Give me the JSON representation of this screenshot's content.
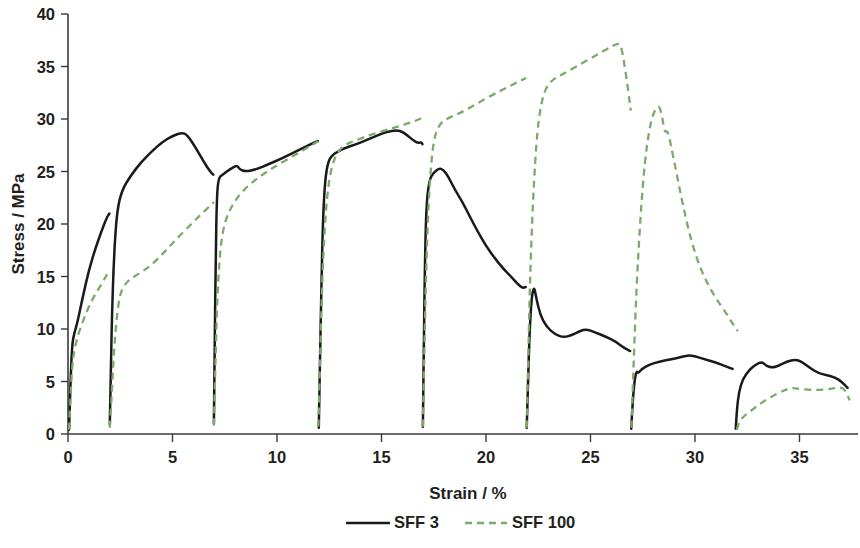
{
  "chart_data": {
    "type": "line",
    "title": "",
    "xlabel": "Strain / %",
    "ylabel": "Stress / MPa",
    "xlim": [
      0,
      37.8
    ],
    "ylim": [
      0,
      40
    ],
    "xticks": [
      0,
      5,
      10,
      15,
      20,
      25,
      30,
      35
    ],
    "yticks": [
      0,
      5,
      10,
      15,
      20,
      25,
      30,
      35,
      40
    ],
    "xtick_labels": [
      "0",
      "5",
      "10",
      "15",
      "20",
      "25",
      "30",
      "35"
    ],
    "ytick_labels": [
      "0",
      "5",
      "10",
      "15",
      "20",
      "25",
      "30",
      "35",
      "40"
    ],
    "grid": false,
    "legend_position": "bottom",
    "series": [
      {
        "name": "SFF 3",
        "color": "#1a1a1a",
        "style": "solid",
        "segments": [
          [
            [
              0.05,
              0.4
            ],
            [
              0.12,
              5.0
            ],
            [
              0.2,
              8.6
            ],
            [
              0.3,
              9.6
            ],
            [
              0.45,
              10.6
            ],
            [
              0.7,
              13.0
            ],
            [
              1.0,
              15.6
            ],
            [
              1.3,
              17.6
            ],
            [
              1.6,
              19.3
            ],
            [
              1.85,
              20.6
            ],
            [
              1.98,
              21.0
            ]
          ],
          [
            [
              2.0,
              0.9
            ],
            [
              2.05,
              6.0
            ],
            [
              2.1,
              11.0
            ],
            [
              2.2,
              17.0
            ],
            [
              2.35,
              21.4
            ],
            [
              2.6,
              23.3
            ],
            [
              3.0,
              24.6
            ],
            [
              3.5,
              25.9
            ],
            [
              4.0,
              26.9
            ],
            [
              4.5,
              27.8
            ],
            [
              5.0,
              28.4
            ],
            [
              5.45,
              28.7
            ],
            [
              5.7,
              28.5
            ],
            [
              6.1,
              27.3
            ],
            [
              6.5,
              25.9
            ],
            [
              6.8,
              25.0
            ],
            [
              6.95,
              24.7
            ]
          ],
          [
            [
              6.98,
              1.0
            ],
            [
              7.02,
              9.0
            ],
            [
              7.07,
              17.0
            ],
            [
              7.12,
              22.5
            ],
            [
              7.2,
              24.4
            ],
            [
              7.4,
              24.7
            ],
            [
              7.8,
              25.3
            ],
            [
              8.1,
              25.6
            ],
            [
              8.2,
              25.2
            ],
            [
              8.5,
              25.0
            ],
            [
              9.0,
              25.2
            ],
            [
              9.6,
              25.7
            ],
            [
              10.3,
              26.3
            ],
            [
              11.0,
              27.0
            ],
            [
              11.6,
              27.6
            ],
            [
              11.95,
              27.9
            ]
          ],
          [
            [
              12.0,
              0.6
            ],
            [
              12.05,
              6.0
            ],
            [
              12.12,
              14.0
            ],
            [
              12.2,
              20.5
            ],
            [
              12.3,
              24.2
            ],
            [
              12.45,
              26.0
            ],
            [
              12.7,
              26.7
            ],
            [
              13.2,
              27.2
            ],
            [
              13.8,
              27.6
            ],
            [
              14.4,
              28.1
            ],
            [
              15.0,
              28.6
            ],
            [
              15.5,
              28.9
            ],
            [
              15.9,
              28.9
            ],
            [
              16.2,
              28.5
            ],
            [
              16.5,
              28.0
            ],
            [
              16.75,
              27.7
            ],
            [
              16.9,
              27.8
            ],
            [
              16.96,
              27.6
            ]
          ],
          [
            [
              16.98,
              0.7
            ],
            [
              17.02,
              8.0
            ],
            [
              17.08,
              16.5
            ],
            [
              17.15,
              22.0
            ],
            [
              17.3,
              24.3
            ],
            [
              17.5,
              24.9
            ],
            [
              17.75,
              25.3
            ],
            [
              17.95,
              25.2
            ],
            [
              18.2,
              24.5
            ],
            [
              18.5,
              23.3
            ],
            [
              18.9,
              22.0
            ],
            [
              19.2,
              20.8
            ],
            [
              19.6,
              19.3
            ],
            [
              20.0,
              17.9
            ],
            [
              20.4,
              16.8
            ],
            [
              20.8,
              15.8
            ],
            [
              21.2,
              15.0
            ],
            [
              21.5,
              14.3
            ],
            [
              21.75,
              13.9
            ],
            [
              21.9,
              14.0
            ]
          ],
          [
            [
              21.95,
              0.6
            ],
            [
              22.0,
              4.0
            ],
            [
              22.08,
              9.5
            ],
            [
              22.18,
              13.0
            ],
            [
              22.3,
              14.1
            ],
            [
              22.4,
              13.0
            ],
            [
              22.6,
              11.3
            ],
            [
              22.9,
              10.2
            ],
            [
              23.3,
              9.5
            ],
            [
              23.7,
              9.2
            ],
            [
              24.1,
              9.4
            ],
            [
              24.5,
              9.8
            ],
            [
              24.8,
              10.0
            ],
            [
              25.2,
              9.7
            ],
            [
              25.7,
              9.3
            ],
            [
              26.2,
              8.8
            ],
            [
              26.6,
              8.2
            ],
            [
              26.9,
              7.9
            ]
          ],
          [
            [
              26.95,
              0.5
            ],
            [
              27.0,
              2.5
            ],
            [
              27.1,
              5.0
            ],
            [
              27.2,
              6.0
            ],
            [
              27.3,
              5.8
            ],
            [
              27.45,
              6.2
            ],
            [
              27.8,
              6.6
            ],
            [
              28.3,
              6.9
            ],
            [
              28.8,
              7.1
            ],
            [
              29.3,
              7.3
            ],
            [
              29.7,
              7.5
            ],
            [
              30.0,
              7.4
            ],
            [
              30.5,
              7.1
            ],
            [
              31.0,
              6.8
            ],
            [
              31.4,
              6.5
            ],
            [
              31.8,
              6.2
            ]
          ],
          [
            [
              31.95,
              0.5
            ],
            [
              32.0,
              2.2
            ],
            [
              32.1,
              4.0
            ],
            [
              32.3,
              5.3
            ],
            [
              32.6,
              6.1
            ],
            [
              32.9,
              6.6
            ],
            [
              33.2,
              6.9
            ],
            [
              33.4,
              6.5
            ],
            [
              33.7,
              6.3
            ],
            [
              34.0,
              6.5
            ],
            [
              34.4,
              6.9
            ],
            [
              34.8,
              7.1
            ],
            [
              35.1,
              6.9
            ],
            [
              35.5,
              6.3
            ],
            [
              35.9,
              5.8
            ],
            [
              36.3,
              5.6
            ],
            [
              36.7,
              5.4
            ],
            [
              37.0,
              5.0
            ],
            [
              37.3,
              4.4
            ]
          ]
        ]
      },
      {
        "name": "SFF 100",
        "color": "#7aab68",
        "style": "dashed",
        "segments": [
          [
            [
              0.05,
              0.4
            ],
            [
              0.12,
              3.5
            ],
            [
              0.2,
              6.5
            ],
            [
              0.3,
              8.0
            ],
            [
              0.5,
              9.6
            ],
            [
              0.8,
              11.2
            ],
            [
              1.1,
              12.6
            ],
            [
              1.4,
              13.6
            ],
            [
              1.7,
              14.6
            ],
            [
              1.95,
              15.5
            ]
          ],
          [
            [
              2.0,
              0.6
            ],
            [
              2.1,
              4.0
            ],
            [
              2.2,
              8.0
            ],
            [
              2.35,
              11.5
            ],
            [
              2.5,
              13.4
            ],
            [
              2.7,
              14.2
            ],
            [
              3.0,
              14.8
            ],
            [
              3.5,
              15.4
            ],
            [
              4.0,
              16.1
            ],
            [
              4.6,
              17.3
            ],
            [
              5.2,
              18.6
            ],
            [
              5.9,
              20.0
            ],
            [
              6.4,
              21.0
            ],
            [
              6.9,
              21.9
            ],
            [
              6.97,
              22.1
            ]
          ],
          [
            [
              6.98,
              0.8
            ],
            [
              7.05,
              6.5
            ],
            [
              7.15,
              13.5
            ],
            [
              7.3,
              18.0
            ],
            [
              7.5,
              20.2
            ],
            [
              7.8,
              21.6
            ],
            [
              8.2,
              22.8
            ],
            [
              8.7,
              23.8
            ],
            [
              9.3,
              24.7
            ],
            [
              10.0,
              25.6
            ],
            [
              10.8,
              26.5
            ],
            [
              11.4,
              27.2
            ],
            [
              11.9,
              27.8
            ],
            [
              11.96,
              27.9
            ]
          ],
          [
            [
              11.98,
              0.7
            ],
            [
              12.05,
              6.0
            ],
            [
              12.15,
              14.0
            ],
            [
              12.3,
              20.5
            ],
            [
              12.5,
              24.5
            ],
            [
              12.8,
              26.6
            ],
            [
              13.2,
              27.5
            ],
            [
              13.8,
              28.0
            ],
            [
              14.5,
              28.5
            ],
            [
              15.3,
              29.0
            ],
            [
              16.0,
              29.4
            ],
            [
              16.6,
              29.8
            ],
            [
              16.93,
              30.1
            ]
          ],
          [
            [
              16.98,
              0.7
            ],
            [
              17.05,
              8.0
            ],
            [
              17.15,
              17.0
            ],
            [
              17.3,
              24.0
            ],
            [
              17.5,
              28.2
            ],
            [
              17.8,
              29.6
            ],
            [
              18.2,
              30.1
            ],
            [
              18.8,
              30.6
            ],
            [
              19.6,
              31.5
            ],
            [
              20.4,
              32.4
            ],
            [
              21.1,
              33.1
            ],
            [
              21.7,
              33.7
            ],
            [
              21.92,
              33.9
            ]
          ],
          [
            [
              21.95,
              0.6
            ],
            [
              22.02,
              7.0
            ],
            [
              22.12,
              16.0
            ],
            [
              22.3,
              24.5
            ],
            [
              22.5,
              30.0
            ],
            [
              22.8,
              32.8
            ],
            [
              23.2,
              33.8
            ],
            [
              23.8,
              34.4
            ],
            [
              24.5,
              35.2
            ],
            [
              25.2,
              36.0
            ],
            [
              25.8,
              36.7
            ],
            [
              26.3,
              37.2
            ],
            [
              26.45,
              37.1
            ],
            [
              26.6,
              35.5
            ],
            [
              26.75,
              33.5
            ],
            [
              26.85,
              32.0
            ],
            [
              26.93,
              30.8
            ]
          ],
          [
            [
              26.96,
              0.6
            ],
            [
              27.05,
              6.0
            ],
            [
              27.2,
              14.0
            ],
            [
              27.4,
              21.0
            ],
            [
              27.6,
              26.0
            ],
            [
              27.85,
              29.5
            ],
            [
              28.1,
              31.0
            ],
            [
              28.3,
              31.3
            ],
            [
              28.45,
              30.0
            ],
            [
              28.55,
              28.7
            ],
            [
              28.7,
              28.9
            ],
            [
              28.85,
              27.5
            ],
            [
              29.1,
              25.0
            ],
            [
              29.4,
              22.0
            ],
            [
              29.8,
              18.5
            ],
            [
              30.3,
              15.5
            ],
            [
              30.9,
              13.2
            ],
            [
              31.5,
              11.5
            ],
            [
              31.9,
              10.2
            ],
            [
              32.05,
              9.8
            ]
          ],
          [
            [
              32.0,
              0.4
            ],
            [
              32.1,
              1.2
            ],
            [
              32.4,
              1.8
            ],
            [
              32.8,
              2.4
            ],
            [
              33.2,
              3.0
            ],
            [
              33.7,
              3.6
            ],
            [
              34.2,
              4.1
            ],
            [
              34.6,
              4.4
            ],
            [
              35.0,
              4.3
            ],
            [
              35.5,
              4.2
            ],
            [
              36.0,
              4.2
            ],
            [
              36.5,
              4.3
            ],
            [
              36.9,
              4.5
            ],
            [
              37.2,
              4.2
            ],
            [
              37.4,
              3.2
            ]
          ]
        ]
      }
    ]
  },
  "legend": {
    "items": [
      {
        "label": "SFF 3",
        "style": "solid",
        "color": "#1a1a1a"
      },
      {
        "label": "SFF 100",
        "style": "dashed",
        "color": "#7aab68"
      }
    ]
  },
  "axes": {
    "x_title": "Strain / %",
    "y_title": "Stress / MPa"
  }
}
